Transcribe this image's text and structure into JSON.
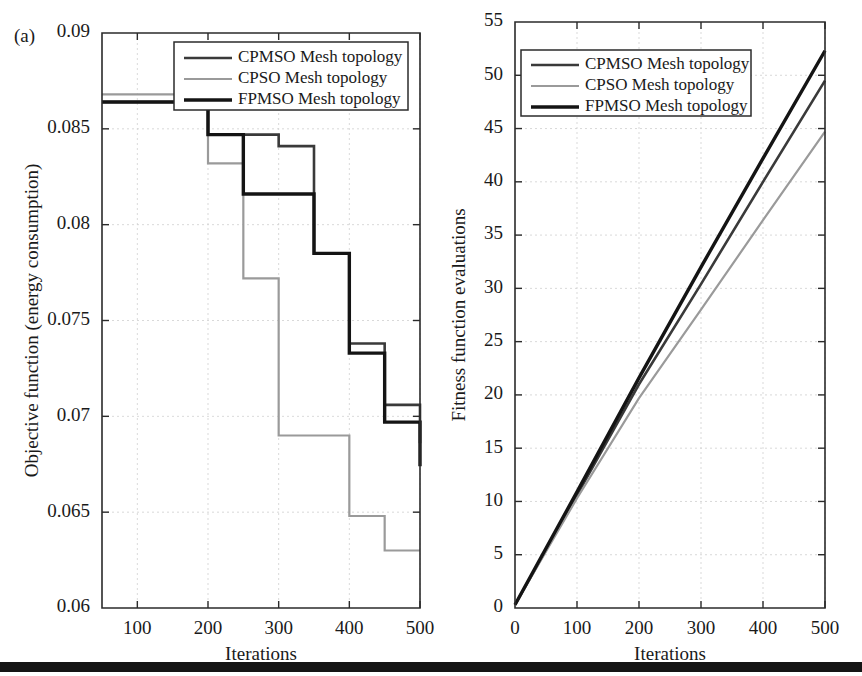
{
  "figure": {
    "panel_tag": "(a)",
    "bottom_rule_color": "#151515",
    "series_colors": {
      "cpmso": "#3a3a3a",
      "cpso": "#9a9a9a",
      "fpmso": "#141414"
    }
  },
  "legend": {
    "entries": [
      {
        "key": "cpmso",
        "label": "CPMSO Mesh topology"
      },
      {
        "key": "cpso",
        "label": "CPSO Mesh topology"
      },
      {
        "key": "fpmso",
        "label": "FPMSO Mesh topology"
      }
    ]
  },
  "chart_data": [
    {
      "id": "left",
      "type": "line",
      "title": "",
      "xlabel": "Iterations",
      "ylabel": "Objective function (energy consumption)",
      "xlim": [
        50,
        500
      ],
      "ylim": [
        0.06,
        0.09
      ],
      "xticks": [
        100,
        200,
        300,
        400,
        500
      ],
      "yticks": [
        0.06,
        0.065,
        0.07,
        0.075,
        0.08,
        0.085,
        0.09
      ],
      "ytick_labels": [
        "0.06",
        "0.065",
        "0.07",
        "0.075",
        "0.08",
        "0.085",
        "0.09"
      ],
      "xtick_labels": [
        "100",
        "200",
        "300",
        "400",
        "500"
      ],
      "grid": true,
      "step_style": "post",
      "legend_position": "upper-right",
      "series": [
        {
          "name": "CPMSO Mesh topology",
          "key": "cpmso",
          "x": [
            50,
            150,
            200,
            250,
            300,
            350,
            400,
            450,
            500
          ],
          "values": [
            0.0864,
            0.0864,
            0.0847,
            0.0847,
            0.0841,
            0.0785,
            0.0738,
            0.0706,
            0.0686
          ]
        },
        {
          "name": "CPSO Mesh topology",
          "key": "cpso",
          "x": [
            50,
            150,
            200,
            250,
            300,
            350,
            400,
            450,
            500
          ],
          "values": [
            0.0868,
            0.0868,
            0.0832,
            0.0772,
            0.069,
            0.069,
            0.0648,
            0.063,
            0.063
          ]
        },
        {
          "name": "FPMSO Mesh topology",
          "key": "fpmso",
          "x": [
            50,
            150,
            200,
            250,
            300,
            350,
            400,
            450,
            500
          ],
          "values": [
            0.0864,
            0.0864,
            0.0847,
            0.0816,
            0.0816,
            0.0785,
            0.0733,
            0.0697,
            0.0674
          ]
        }
      ]
    },
    {
      "id": "right",
      "type": "line",
      "title": "",
      "xlabel": "Iterations",
      "ylabel": "Fitness function evaluations",
      "xlim": [
        0,
        500
      ],
      "ylim": [
        0,
        55
      ],
      "xticks": [
        0,
        100,
        200,
        300,
        400,
        500
      ],
      "yticks": [
        0,
        5,
        10,
        15,
        20,
        25,
        30,
        35,
        40,
        45,
        50,
        55
      ],
      "ytick_labels": [
        "0",
        "5",
        "10",
        "15",
        "20",
        "25",
        "30",
        "35",
        "40",
        "45",
        "50",
        "55"
      ],
      "xtick_labels": [
        "0",
        "100",
        "200",
        "300",
        "400",
        "500"
      ],
      "grid": true,
      "legend_position": "upper-left",
      "series": [
        {
          "name": "CPMSO Mesh topology",
          "key": "cpmso",
          "x": [
            0,
            100,
            200,
            300,
            400,
            500
          ],
          "values": [
            0.3,
            10.6,
            21.0,
            30.4,
            40.0,
            49.5
          ]
        },
        {
          "name": "CPSO Mesh topology",
          "key": "cpso",
          "x": [
            0,
            100,
            200,
            300,
            400,
            500
          ],
          "values": [
            0.3,
            10.3,
            19.7,
            28.0,
            36.4,
            44.7
          ]
        },
        {
          "name": "FPMSO Mesh topology",
          "key": "fpmso",
          "x": [
            0,
            100,
            200,
            300,
            400,
            500
          ],
          "values": [
            0.3,
            10.9,
            21.6,
            32.0,
            42.2,
            52.3
          ]
        }
      ]
    }
  ]
}
